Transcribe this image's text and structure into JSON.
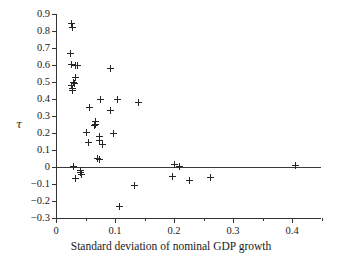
{
  "chart_data": {
    "type": "scatter",
    "title": "",
    "xlabel": "Standard deviation of nominal GDP growth",
    "ylabel": "τ",
    "xlim": [
      0,
      0.449
    ],
    "ylim": [
      -0.3,
      0.9
    ],
    "xticks": [
      0,
      0.1,
      0.2,
      0.3,
      0.4
    ],
    "xtick_labels": [
      "0",
      "0.1",
      "0.2",
      "0.3",
      "0.4"
    ],
    "xminor_ticks": [
      0.05,
      0.15,
      0.25,
      0.35,
      0.45
    ],
    "yticks": [
      -0.3,
      -0.2,
      -0.1,
      0,
      0.1,
      0.2,
      0.3,
      0.4,
      0.5,
      0.6,
      0.7,
      0.8,
      0.9
    ],
    "ytick_labels": [
      "−0.3",
      "−0.2",
      "−0.1",
      "0",
      "0.1",
      "0.2",
      "0.3",
      "0.4",
      "0.5",
      "0.6",
      "0.7",
      "0.8",
      "0.9"
    ],
    "grid": false,
    "legend": null,
    "reference_lines": [
      {
        "orientation": "horizontal",
        "y": 0
      }
    ],
    "marker": "plus",
    "marker_color": "#262626",
    "points": [
      {
        "x": 0.0265,
        "y": 0.845
      },
      {
        "x": 0.0275,
        "y": 0.818
      },
      {
        "x": 0.025,
        "y": 0.668
      },
      {
        "x": 0.0265,
        "y": 0.605
      },
      {
        "x": 0.033,
        "y": 0.6
      },
      {
        "x": 0.036,
        "y": 0.598
      },
      {
        "x": 0.0925,
        "y": 0.582
      },
      {
        "x": 0.033,
        "y": 0.525
      },
      {
        "x": 0.029,
        "y": 0.5
      },
      {
        "x": 0.031,
        "y": 0.492
      },
      {
        "x": 0.0265,
        "y": 0.478
      },
      {
        "x": 0.0275,
        "y": 0.462
      },
      {
        "x": 0.028,
        "y": 0.448
      },
      {
        "x": 0.076,
        "y": 0.398
      },
      {
        "x": 0.104,
        "y": 0.396
      },
      {
        "x": 0.14,
        "y": 0.378
      },
      {
        "x": 0.0575,
        "y": 0.35
      },
      {
        "x": 0.092,
        "y": 0.332
      },
      {
        "x": 0.0665,
        "y": 0.268
      },
      {
        "x": 0.067,
        "y": 0.252
      },
      {
        "x": 0.066,
        "y": 0.242
      },
      {
        "x": 0.052,
        "y": 0.205
      },
      {
        "x": 0.098,
        "y": 0.195
      },
      {
        "x": 0.074,
        "y": 0.178
      },
      {
        "x": 0.0745,
        "y": 0.158
      },
      {
        "x": 0.0545,
        "y": 0.145
      },
      {
        "x": 0.079,
        "y": 0.13
      },
      {
        "x": 0.07,
        "y": 0.052
      },
      {
        "x": 0.074,
        "y": 0.042
      },
      {
        "x": 0.03,
        "y": 0.005
      },
      {
        "x": 0.201,
        "y": 0.012
      },
      {
        "x": 0.209,
        "y": 0.002
      },
      {
        "x": 0.406,
        "y": 0.008
      },
      {
        "x": 0.041,
        "y": -0.018
      },
      {
        "x": 0.042,
        "y": -0.032
      },
      {
        "x": 0.0425,
        "y": -0.042
      },
      {
        "x": 0.0325,
        "y": -0.068
      },
      {
        "x": 0.198,
        "y": -0.055
      },
      {
        "x": 0.262,
        "y": -0.06
      },
      {
        "x": 0.2265,
        "y": -0.078
      },
      {
        "x": 0.133,
        "y": -0.108
      },
      {
        "x": 0.1075,
        "y": -0.233
      }
    ]
  }
}
